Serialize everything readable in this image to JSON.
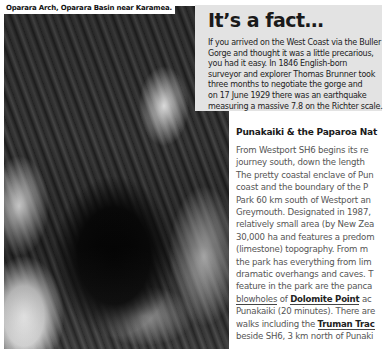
{
  "photo": {
    "caption": "Oparara Arch, Oparara Basin near Karamea."
  },
  "fact_box": {
    "title": "It’s a fact…",
    "lines": [
      "If you arrived on the West Coast via the Buller",
      "Gorge and thought it was a little precarious,",
      "you had it easy. In 1846 English-born",
      "surveyor and explorer Thomas Brunner took",
      "three months to negotiate the gorge and",
      "on 17 June 1929 there was an earthquake",
      "measuring a massive 7.8 on the Richter scale."
    ]
  },
  "article": {
    "title": "Punakaiki & the Paparoa Nat",
    "lines": [
      "From Westport SH6 begins its re",
      "journey south, down the length",
      "The pretty coastal enclave of Pun",
      "coast and the boundary of the P",
      "Park 60 km south of Westport an",
      "Greymouth. Designated in 1987,",
      "relatively small area (by New Zea",
      "30,000 ha and features a predom",
      "(limestone) topography. From m",
      "the park has everything from lim",
      "dramatic overhangs and caves. T",
      "feature in the park are the panca"
    ],
    "line_blowholes": {
      "pre": "blowholes",
      "mid": " of ",
      "link": "Dolomite Point",
      "post": " ac"
    },
    "line_punakaiki": "Punakaiki (20 minutes). There are",
    "line_truman": {
      "pre": "walks including the ",
      "link": "Truman Trac"
    },
    "line_last": "beside SH6, 3 km north of Punaki"
  }
}
